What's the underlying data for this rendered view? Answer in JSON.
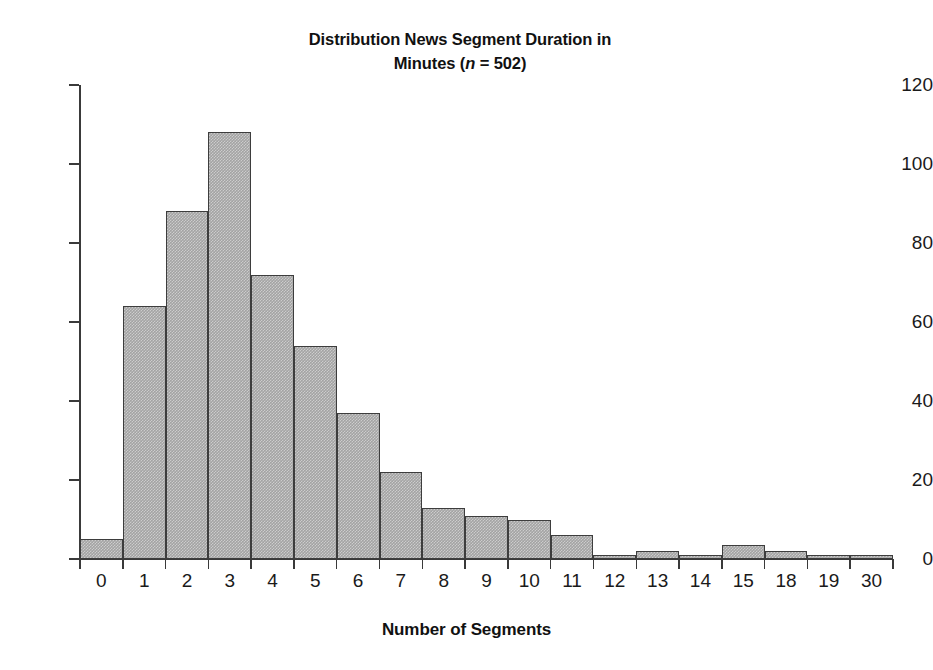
{
  "chart_data": {
    "type": "bar",
    "title": "Distribution News Segment Duration in Minutes (n = 502)",
    "title_line1": "Distribution News Segment Duration in",
    "title_line2_prefix": "Minutes (",
    "title_line2_italic": "n",
    "title_line2_suffix": " = 502)",
    "sample_size": 502,
    "xlabel": "Number of Segments",
    "ylabel": "",
    "categories": [
      "0",
      "1",
      "2",
      "3",
      "4",
      "5",
      "6",
      "7",
      "8",
      "9",
      "10",
      "11",
      "12",
      "13",
      "14",
      "15",
      "18",
      "19",
      "30"
    ],
    "values": [
      5,
      64,
      88,
      108,
      72,
      54,
      37,
      22,
      13,
      11,
      10,
      6,
      1,
      2,
      1,
      3.5,
      2,
      1,
      1
    ],
    "ylim": [
      0,
      120
    ],
    "yticks": [
      0,
      20,
      40,
      60,
      80,
      100,
      120
    ],
    "ytick_labels": [
      "0",
      "20",
      "40",
      "60",
      "80",
      "100",
      "120"
    ],
    "grid": false,
    "legend": false,
    "legend_position": "none",
    "bar_fill_color": "#a3a3a3",
    "bar_edge_color": "#3d3d3d",
    "axis_color": "#3a3a3a",
    "background_color": "#ffffff"
  }
}
